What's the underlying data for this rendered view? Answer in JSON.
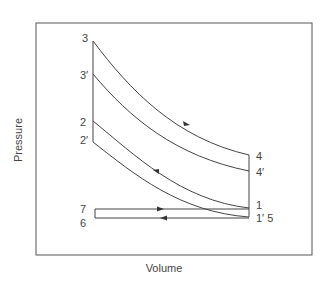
{
  "diagram": {
    "type": "pressure-volume cycle diagram",
    "xlabel": "Volume",
    "ylabel": "Pressure",
    "colors": {
      "line": "#444444",
      "frame": "#555555",
      "text": "#444444"
    },
    "points": [
      {
        "id": "3",
        "label": "3",
        "x": 93,
        "y": 41
      },
      {
        "id": "3p",
        "label": "3′",
        "x": 93,
        "y": 74
      },
      {
        "id": "2",
        "label": "2",
        "x": 93,
        "y": 121
      },
      {
        "id": "2p",
        "label": "2′",
        "x": 93,
        "y": 142
      },
      {
        "id": "4",
        "label": "4",
        "x": 249,
        "y": 155
      },
      {
        "id": "4p",
        "label": "4′",
        "x": 249,
        "y": 171
      },
      {
        "id": "1",
        "label": "1",
        "x": 249,
        "y": 208
      },
      {
        "id": "1p5",
        "label": "1′ 5",
        "x": 249,
        "y": 217
      },
      {
        "id": "7",
        "label": "7",
        "x": 95,
        "y": 209
      },
      {
        "id": "6",
        "label": "6",
        "x": 95,
        "y": 218
      }
    ],
    "curves": [
      {
        "name": "expansion 3-4",
        "from": "3",
        "to": "4",
        "arrow": true
      },
      {
        "name": "expansion 3'-4'",
        "from": "3p",
        "to": "4p",
        "arrow": false
      },
      {
        "name": "compression 1-2",
        "from": "1",
        "to": "2",
        "arrow": true
      },
      {
        "name": "compression 1'-2'",
        "from": "1p5",
        "to": "2p",
        "arrow": false
      }
    ],
    "pumping_loop": {
      "upper": "7 to 1 (arrow right)",
      "lower": "5 to 6 (arrow left)"
    }
  }
}
